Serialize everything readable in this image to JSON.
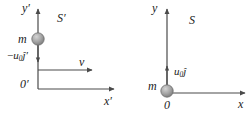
{
  "figure": {
    "type": "physics-diagram",
    "colors": {
      "axis": "#4a4a4a",
      "text": "#1b1b1b",
      "mass_fill": "#9e9e9e",
      "mass_edge": "#6e6e6e",
      "background": "#ffffff"
    }
  },
  "frames": [
    {
      "id": "s-prime",
      "frame_label": "S′",
      "y_axis_label": "y′",
      "x_axis_label": "x′",
      "origin_label": "0′",
      "mass_label": "m",
      "velocity_label_parts": {
        "sign": "−",
        "symbol": "u",
        "subscript": "0",
        "unit_vector": "ĵ′"
      },
      "velocity_label": "−u₀ĵ′",
      "velocity_direction": "down",
      "frame_velocity_label": "v⃗",
      "frame_velocity_direction": "right"
    },
    {
      "id": "s",
      "frame_label": "S",
      "y_axis_label": "y",
      "x_axis_label": "x",
      "origin_label": "0",
      "mass_label": "m",
      "velocity_label_parts": {
        "sign": "",
        "symbol": "u",
        "subscript": "0",
        "unit_vector": "ĵ"
      },
      "velocity_label": "u₀ĵ",
      "velocity_direction": "up"
    }
  ]
}
